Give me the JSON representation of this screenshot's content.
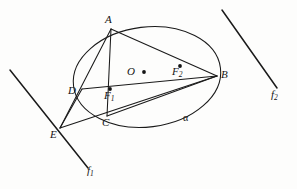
{
  "figure": {
    "kind": "geometry-diagram",
    "stroke_color": "#1a1a1a",
    "background_color": "#fdfdfc",
    "canvas": {
      "width": 297,
      "height": 189
    }
  },
  "labels": {
    "A": "A",
    "B": "B",
    "C": "C",
    "D": "D",
    "E": "E",
    "O": "O",
    "F1_base": "F",
    "F1_sub": "1",
    "F2_base": "F",
    "F2_sub": "2",
    "f1_base": "f",
    "f1_sub": "1",
    "f2_base": "f",
    "f2_sub": "2",
    "alpha": "α"
  },
  "points": {
    "A": {
      "x": 111,
      "y": 29,
      "marked": false
    },
    "B": {
      "x": 217,
      "y": 76,
      "marked": false
    },
    "C": {
      "x": 107,
      "y": 116,
      "marked": false
    },
    "D": {
      "x": 82,
      "y": 89,
      "marked": false
    },
    "E": {
      "x": 60,
      "y": 128,
      "marked": false
    },
    "O": {
      "x": 144,
      "y": 72,
      "marked": true
    },
    "F1": {
      "x": 110,
      "y": 89,
      "marked": true
    },
    "F2": {
      "x": 180,
      "y": 66,
      "marked": true
    }
  },
  "ellipse": {
    "cx": 147,
    "cy": 77,
    "rx": 74,
    "ry": 50,
    "rotation_deg": -7
  },
  "segments": [
    {
      "name": "A-B",
      "from": "A",
      "to": "B"
    },
    {
      "name": "A-C",
      "from": "A",
      "to": "C"
    },
    {
      "name": "A-E",
      "from": "A",
      "to": "E"
    },
    {
      "name": "D-B",
      "from": "D",
      "to": "B"
    },
    {
      "name": "D-E",
      "from": "D",
      "to": "E"
    },
    {
      "name": "C-B",
      "from": "C",
      "to": "B"
    },
    {
      "name": "E-B",
      "from": "E",
      "to": "B"
    }
  ],
  "lines": {
    "f1": {
      "x1": 10,
      "y1": 70,
      "x2": 88,
      "y2": 168
    },
    "f2": {
      "x1": 222,
      "y1": 10,
      "x2": 277,
      "y2": 88
    }
  },
  "label_positions": {
    "A": {
      "left": 105,
      "top": 14
    },
    "B": {
      "left": 221,
      "top": 69
    },
    "C": {
      "left": 102,
      "top": 117
    },
    "D": {
      "left": 68,
      "top": 85
    },
    "E": {
      "left": 50,
      "top": 129
    },
    "O": {
      "left": 127,
      "top": 66
    },
    "F1": {
      "left": 104,
      "top": 90
    },
    "F2": {
      "left": 172,
      "top": 66
    },
    "f1": {
      "left": 87,
      "top": 165
    },
    "f2": {
      "left": 271,
      "top": 89
    },
    "alpha": {
      "left": 183,
      "top": 113
    }
  }
}
